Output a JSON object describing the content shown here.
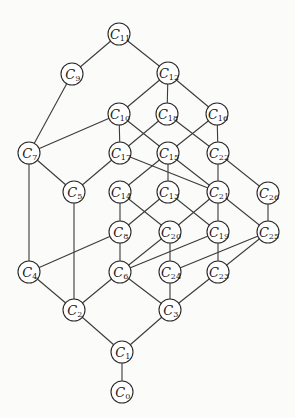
{
  "diagram": {
    "type": "lattice-graph",
    "node_radius": 11,
    "colors": {
      "node_fill": "#ffffff",
      "node_stroke": "#2a2a2a",
      "edge": "#3a3a3a",
      "background": "#fbfbf9"
    },
    "nodes": [
      {
        "id": "C11",
        "letter": "C",
        "sub": "11",
        "x": 119,
        "y": 34
      },
      {
        "id": "C9",
        "letter": "C",
        "sub": "9",
        "x": 72,
        "y": 74
      },
      {
        "id": "C12",
        "letter": "C",
        "sub": "12",
        "x": 168,
        "y": 73
      },
      {
        "id": "C10",
        "letter": "C",
        "sub": "10",
        "x": 119,
        "y": 114
      },
      {
        "id": "C18",
        "letter": "C",
        "sub": "18",
        "x": 167,
        "y": 114
      },
      {
        "id": "C16",
        "letter": "C",
        "sub": "16",
        "x": 217,
        "y": 114
      },
      {
        "id": "C7",
        "letter": "C",
        "sub": "7",
        "x": 29,
        "y": 153
      },
      {
        "id": "C17",
        "letter": "C",
        "sub": "17",
        "x": 120,
        "y": 153
      },
      {
        "id": "C15",
        "letter": "C",
        "sub": "15",
        "x": 168,
        "y": 153
      },
      {
        "id": "C22",
        "letter": "C",
        "sub": "22",
        "x": 218,
        "y": 153
      },
      {
        "id": "C5",
        "letter": "C",
        "sub": "5",
        "x": 74,
        "y": 192
      },
      {
        "id": "C14",
        "letter": "C",
        "sub": "14",
        "x": 120,
        "y": 192
      },
      {
        "id": "C13",
        "letter": "C",
        "sub": "13",
        "x": 168,
        "y": 192
      },
      {
        "id": "C21",
        "letter": "C",
        "sub": "21",
        "x": 218,
        "y": 192
      },
      {
        "id": "C26",
        "letter": "C",
        "sub": "26",
        "x": 268,
        "y": 193
      },
      {
        "id": "C8",
        "letter": "C",
        "sub": "8",
        "x": 120,
        "y": 232
      },
      {
        "id": "C20",
        "letter": "C",
        "sub": "20",
        "x": 170,
        "y": 232
      },
      {
        "id": "C19",
        "letter": "C",
        "sub": "19",
        "x": 218,
        "y": 232
      },
      {
        "id": "C25",
        "letter": "C",
        "sub": "25",
        "x": 268,
        "y": 232
      },
      {
        "id": "C4",
        "letter": "C",
        "sub": "4",
        "x": 29,
        "y": 272
      },
      {
        "id": "C6",
        "letter": "C",
        "sub": "6",
        "x": 120,
        "y": 272
      },
      {
        "id": "C24",
        "letter": "C",
        "sub": "24",
        "x": 170,
        "y": 272
      },
      {
        "id": "C23",
        "letter": "C",
        "sub": "23",
        "x": 218,
        "y": 272
      },
      {
        "id": "C2",
        "letter": "C",
        "sub": "2",
        "x": 74,
        "y": 310
      },
      {
        "id": "C3",
        "letter": "C",
        "sub": "3",
        "x": 170,
        "y": 310
      },
      {
        "id": "C1",
        "letter": "C",
        "sub": "1",
        "x": 122,
        "y": 352
      },
      {
        "id": "C0",
        "letter": "C",
        "sub": "0",
        "x": 122,
        "y": 392
      }
    ],
    "edges": [
      [
        "C11",
        "C9"
      ],
      [
        "C11",
        "C12"
      ],
      [
        "C9",
        "C7"
      ],
      [
        "C12",
        "C10"
      ],
      [
        "C12",
        "C18"
      ],
      [
        "C12",
        "C16"
      ],
      [
        "C10",
        "C7"
      ],
      [
        "C10",
        "C17"
      ],
      [
        "C10",
        "C15"
      ],
      [
        "C18",
        "C17"
      ],
      [
        "C18",
        "C22"
      ],
      [
        "C16",
        "C15"
      ],
      [
        "C16",
        "C22"
      ],
      [
        "C7",
        "C5"
      ],
      [
        "C7",
        "C4"
      ],
      [
        "C17",
        "C5"
      ],
      [
        "C17",
        "C21"
      ],
      [
        "C15",
        "C14"
      ],
      [
        "C15",
        "C13"
      ],
      [
        "C15",
        "C21"
      ],
      [
        "C22",
        "C21"
      ],
      [
        "C22",
        "C26"
      ],
      [
        "C5",
        "C2"
      ],
      [
        "C14",
        "C8"
      ],
      [
        "C14",
        "C20"
      ],
      [
        "C13",
        "C8"
      ],
      [
        "C13",
        "C19"
      ],
      [
        "C21",
        "C20"
      ],
      [
        "C21",
        "C19"
      ],
      [
        "C21",
        "C25"
      ],
      [
        "C26",
        "C25"
      ],
      [
        "C8",
        "C4"
      ],
      [
        "C8",
        "C6"
      ],
      [
        "C20",
        "C6"
      ],
      [
        "C20",
        "C24"
      ],
      [
        "C19",
        "C6"
      ],
      [
        "C19",
        "C23"
      ],
      [
        "C25",
        "C24"
      ],
      [
        "C25",
        "C23"
      ],
      [
        "C4",
        "C2"
      ],
      [
        "C6",
        "C2"
      ],
      [
        "C6",
        "C3"
      ],
      [
        "C24",
        "C3"
      ],
      [
        "C23",
        "C3"
      ],
      [
        "C2",
        "C1"
      ],
      [
        "C3",
        "C1"
      ],
      [
        "C1",
        "C0"
      ]
    ]
  }
}
